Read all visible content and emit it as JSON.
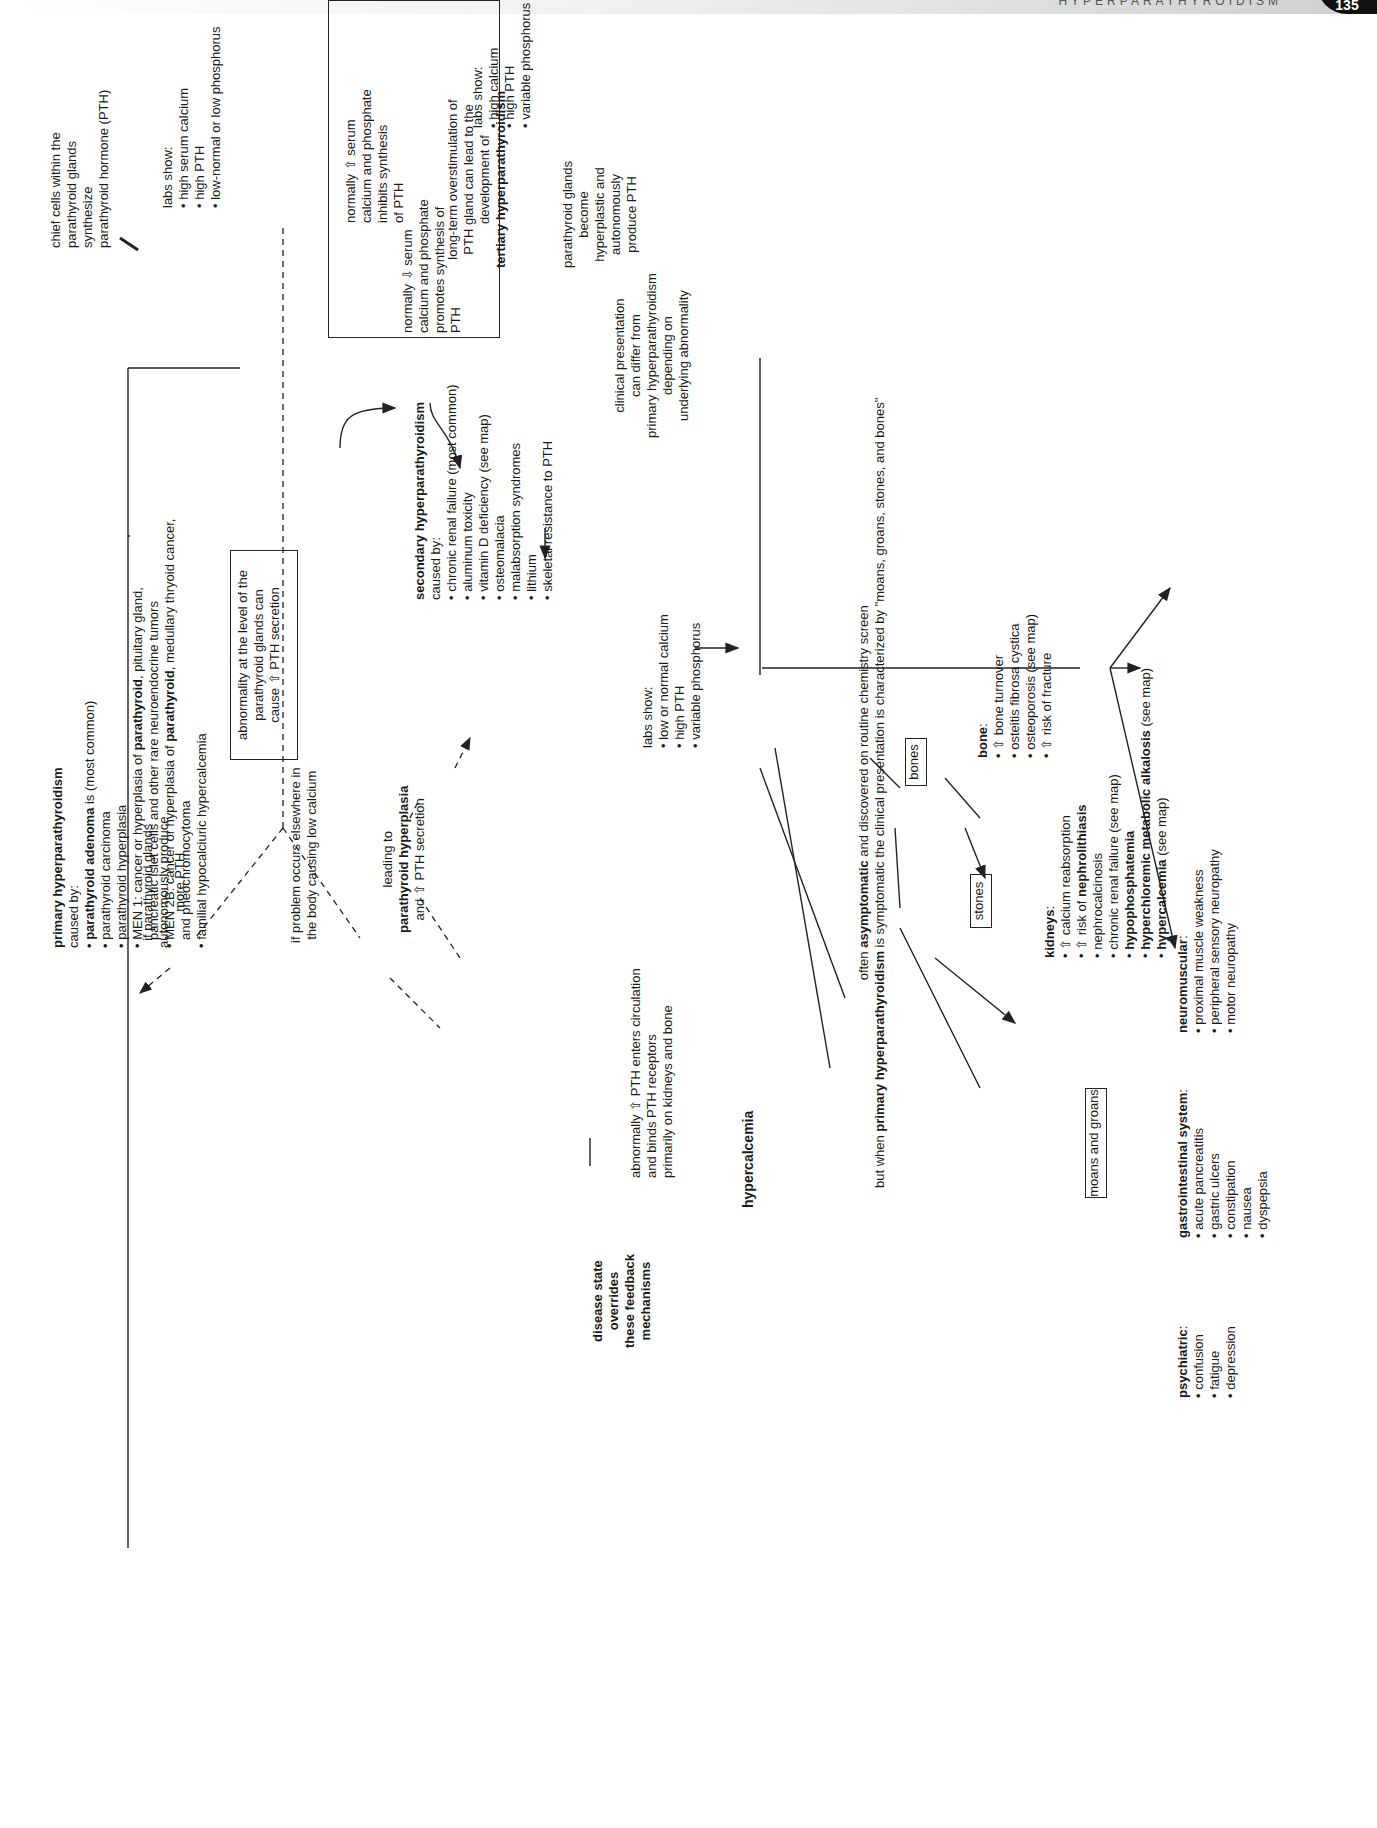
{
  "header": {
    "running_title": "HYPERPARATHYROIDISM",
    "page_number": "135"
  },
  "nodes": {
    "chief_cells": [
      "chief cells within the",
      "parathyroid glands",
      "synthesize",
      "parathyroid hormone (PTH)"
    ],
    "feedback_inhibit": [
      "normally ⇧ serum",
      "calcium and phosphate",
      "inhibits synthesis",
      "of PTH"
    ],
    "feedback_promote": [
      "normally ⇩ serum",
      "calcium and phosphate",
      "promotes synthesis of",
      "PTH"
    ],
    "abnormality_box": [
      "abnormality at the level of the",
      "parathyroid glands can",
      "cause ⇧ PTH secretion"
    ],
    "branch_autonomous": [
      "if parathyroid glands",
      "autonomously produce",
      "more PTH"
    ],
    "branch_elsewhere": [
      "if problem occurs elsewhere in",
      "the body causing low calcium"
    ],
    "leading_to": {
      "line1": "leading to",
      "bold": "parathyroid hyperplasia",
      "line3": "and ⇧ PTH secretion"
    },
    "disease_state": [
      "disease state",
      "overrides",
      "these feedback",
      "mechanisms"
    ],
    "pth_circulation": [
      "abnormally ⇧ PTH enters circulation",
      "and binds PTH receptors",
      "primarily on kidneys and bone"
    ],
    "hypercalcemia": "hypercalcemia",
    "asymptomatic_note": {
      "l1_pre": "often ",
      "l1_bold": "asymptomatic",
      "l1_post": " and discovered on routine chemistry screen",
      "l2_pre": "but when ",
      "l2_bold": "primary hyperparathyroidism",
      "l2_post": " is symptomatic the clinical presentation is characterized by \"moans, groans, stones, and bones\""
    }
  },
  "primary": {
    "title": "primary hyperparathyroidism",
    "caused_by": "caused by:",
    "causes": [
      {
        "bold": "parathyroid adenoma",
        "rest": " is (most common)"
      },
      {
        "text": "parathyroid carcinoma"
      },
      {
        "text": "parathyroid hyperplasia"
      },
      {
        "pre": "MEN 1: cancer or hyperplasia of ",
        "bold": "parathyroid",
        "post": ", pituitary gland,",
        "cont": "pancreatic islet cells and other rare neuroendocrine tumors"
      },
      {
        "pre": "MEN 2B: cancer or hyperplasia of ",
        "bold": "parathyroid",
        "post": ", medullary thryoid cancer,",
        "cont": "and pheochromocytoma"
      },
      {
        "text": "familial hypocalciuric hypercalcemia"
      }
    ],
    "labs_title": "labs show:",
    "labs": [
      "high serum calcium",
      "high PTH",
      "low-normal or low phosphorus"
    ]
  },
  "secondary": {
    "title": "secondary hyperparathyroidism",
    "caused_by": "caused by:",
    "causes": [
      "chronic renal failure (most common)",
      "aluminum toxicity",
      "vitamin D deficiency (see map)",
      "osteomalacia",
      "malabsorption syndromes",
      "lithium",
      "skeletal resistance to PTH"
    ],
    "labs_title": "labs show:",
    "labs": [
      "low or normal calcium",
      "high PTH",
      "variable phosphorus"
    ],
    "clinical": [
      "clinical presentation",
      "can differ from",
      "primary hyperparathyroidism",
      "depending on",
      "underlying abnormality"
    ]
  },
  "tertiary": {
    "lead": [
      "long-term overstimulation of",
      "PTH gland can lead to the",
      "development of"
    ],
    "title": "tertiary hyperparathyroidism",
    "labs_title": "labs show:",
    "labs": [
      "high calcium",
      "high PTH",
      "variable phosphorus"
    ],
    "glands": [
      "parathyroid glands",
      "become",
      "hyperplastic and",
      "autonomously",
      "produce PTH"
    ]
  },
  "categories": {
    "bones": "bones",
    "stones": "stones",
    "moans_groans": "moans and groans"
  },
  "bone": {
    "title": "bone",
    "items": [
      "⇧ bone turnover",
      "osteitis fibrosa cystica",
      "osteoporosis (see map)",
      "⇧ risk of fracture"
    ]
  },
  "kidneys": {
    "title": "kidneys",
    "items": [
      {
        "text": "⇧ calcium reabsorption"
      },
      {
        "pre": "⇧ risk of ",
        "bold": "nephrolithiasis"
      },
      {
        "text": "nephrocalcinosis"
      },
      {
        "text": "chronic renal failure (see map)"
      },
      {
        "bold": "hypophosphatemia"
      },
      {
        "bold": "hyperchloremic metabolic alkalosis",
        "post": " (see map)"
      },
      {
        "bold": "hypercalcemia",
        "post": " (see map)"
      }
    ]
  },
  "psychiatric": {
    "title": "psychiatric",
    "items": [
      "confusion",
      "fatigue",
      "depression"
    ]
  },
  "gastrointestinal": {
    "title": "gastrointestinal system",
    "items": [
      "acute pancreatitis",
      "gastric ulcers",
      "constipation",
      "nausea",
      "dyspepsia"
    ]
  },
  "neuromuscular": {
    "title": "neuromuscular",
    "items": [
      "proximal muscle weakness",
      "peripheral sensory neuropathy",
      "motor neuropathy"
    ]
  }
}
